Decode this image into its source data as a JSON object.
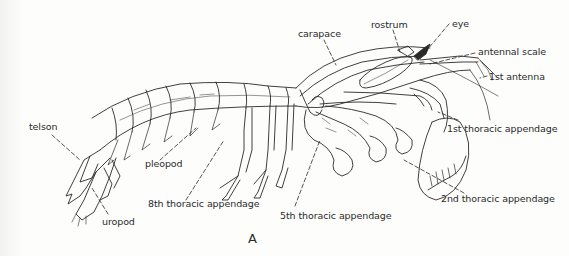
{
  "figure": {
    "letter": "A",
    "line_color": "#2a2a2a",
    "background": "#fdfdfc"
  },
  "labels": {
    "carapace": "carapace",
    "rostrum": "rostrum",
    "eye": "eye",
    "antennal_scale": "antennal scale",
    "first_antenna": "1st antenna",
    "first_thoracic": "1st thoracic appendage",
    "second_thoracic": "2nd thoracic appendage",
    "fifth_thoracic": "5th thoracic appendage",
    "eighth_thoracic": "8th thoracic appendage",
    "pleopod": "pleopod",
    "telson": "telson",
    "uropod": "uropod"
  }
}
